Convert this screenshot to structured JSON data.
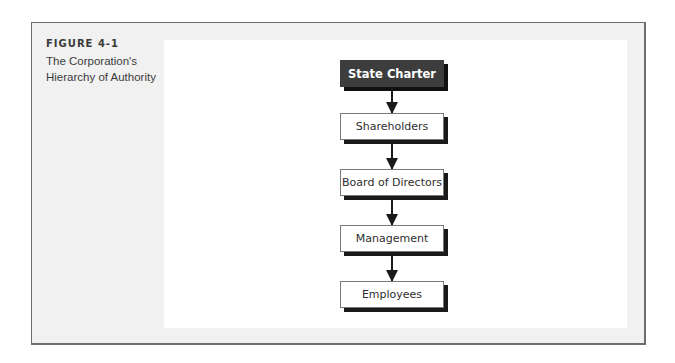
{
  "figure": {
    "number": "FIGURE 4-1",
    "title": "The Corporation's Hierarchy of Authority"
  },
  "diagram": {
    "type": "hierarchy-flow",
    "direction": "top-to-bottom",
    "nodes": [
      {
        "id": "state-charter",
        "label": "State Charter",
        "style": "dark"
      },
      {
        "id": "shareholders",
        "label": "Shareholders",
        "style": "light"
      },
      {
        "id": "board",
        "label": "Board of Directors",
        "style": "light"
      },
      {
        "id": "management",
        "label": "Management",
        "style": "light"
      },
      {
        "id": "employees",
        "label": "Employees",
        "style": "light"
      }
    ],
    "edges": [
      {
        "from": "state-charter",
        "to": "shareholders"
      },
      {
        "from": "shareholders",
        "to": "board"
      },
      {
        "from": "board",
        "to": "management"
      },
      {
        "from": "management",
        "to": "employees"
      }
    ]
  },
  "colors": {
    "dark_node": "#3d3d3d",
    "frame_background": "#f1f1f1",
    "panel_background": "#ffffff",
    "shadow": "#1a1a1a"
  }
}
